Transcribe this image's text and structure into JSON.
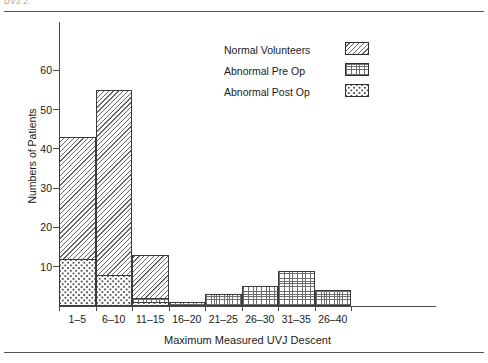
{
  "figure": {
    "top_caption": "UVJ 2.",
    "rules": [
      "top-rule",
      "bottom-rule"
    ]
  },
  "chart_data": {
    "type": "bar",
    "title": "",
    "subtitle": "",
    "xlabel": "Maximum Measured UVJ Descent",
    "ylabel": "Numbers of Patients",
    "categories": [
      "1–5",
      "6–10",
      "11–15",
      "16–20",
      "21–25",
      "26–30",
      "31–35",
      "26–40"
    ],
    "ylim": [
      0,
      68
    ],
    "yticks": [
      10,
      20,
      30,
      40,
      50,
      60
    ],
    "ytick_labels": [
      "10",
      "20",
      "30",
      "40",
      "50",
      "60"
    ],
    "grid": false,
    "legend_position": "upper-right",
    "overlap_style": "overlaid",
    "series": [
      {
        "name": "Normal Volunteers",
        "pattern": "diagonal-hatch",
        "color": "#676767",
        "values": [
          43,
          55,
          13,
          0,
          0,
          0,
          0,
          0
        ]
      },
      {
        "name": "Abnormal Pre Op",
        "pattern": "fine-grid",
        "color": "#6e6e6e",
        "values": [
          0,
          0,
          2,
          1,
          3,
          5,
          9,
          4
        ]
      },
      {
        "name": "Abnormal Post Op",
        "pattern": "dense-stipple",
        "color": "#4f4f4f",
        "values": [
          12,
          8,
          1,
          0,
          0,
          0,
          0,
          0
        ]
      }
    ]
  },
  "legend": {
    "items": [
      {
        "label": "Normal Volunteers",
        "swatch": "diagonal-hatch-swatch"
      },
      {
        "label": "Abnormal Pre Op",
        "swatch": "fine-grid-swatch"
      },
      {
        "label": "Abnormal Post Op",
        "swatch": "dense-stipple-swatch"
      }
    ]
  }
}
